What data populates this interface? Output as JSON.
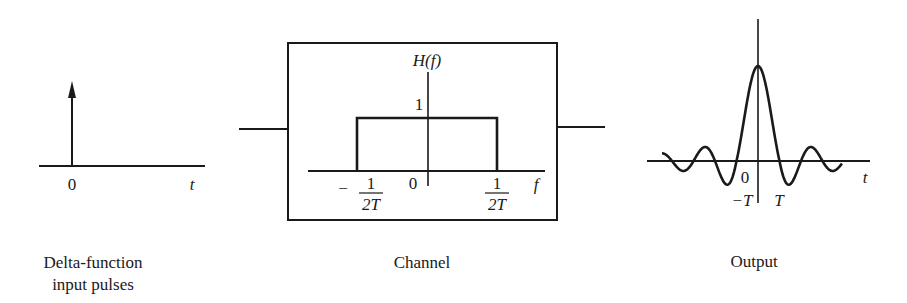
{
  "figure": {
    "colors": {
      "ink": "#1a1a1a",
      "background": "#ffffff"
    },
    "input_panel": {
      "caption_line1": "Delta-function",
      "caption_line2": "input pulses",
      "origin_label": "0",
      "axis_label": "t"
    },
    "channel_panel": {
      "caption": "Channel",
      "y_label": "H(f)",
      "level_label": "1",
      "origin_label": "0",
      "axis_label": "f",
      "left_cutoff_sign": "−",
      "left_cutoff_num": "1",
      "left_cutoff_den": "2T",
      "right_cutoff_num": "1",
      "right_cutoff_den": "2T"
    },
    "output_panel": {
      "caption": "Output",
      "origin_label": "0",
      "axis_label": "t",
      "neg_T_label": "−T",
      "pos_T_label": "T"
    }
  }
}
